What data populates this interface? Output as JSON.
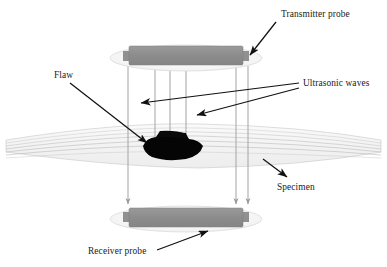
{
  "figure": {
    "background_color": "#ffffff"
  },
  "labels": {
    "transmitter_probe": "Transmitter probe",
    "flaw": "Flaw",
    "ultrasonic_waves": "Ultrasonic waves",
    "specimen": "Specimen",
    "receiver_probe": "Receiver probe"
  },
  "colors": {
    "probe_body": "#8e8e8e",
    "probe_disc": "#f2f2f2",
    "probe_disc_stroke": "#d8d8d8",
    "specimen_fill": "#f4f4f4",
    "specimen_line": "#b9b9b9",
    "wave_line": "#a8a8a8",
    "flaw": "#000000",
    "label_text": "#1a1a1a",
    "leader_line": "#111111"
  },
  "components": {
    "transmitter_probe": {
      "name": "Transmitter probe",
      "disc_center_x": 186,
      "disc_center_y": 58,
      "disc_rx": 76,
      "disc_ry": 13,
      "body_x": 129,
      "body_y": 46,
      "body_width": 114,
      "body_height": 19
    },
    "receiver_probe": {
      "name": "Receiver probe",
      "disc_center_x": 186,
      "disc_center_y": 219,
      "disc_rx": 76,
      "disc_ry": 13,
      "body_x": 129,
      "body_y": 208,
      "body_width": 114,
      "body_height": 19
    },
    "specimen": {
      "name": "Specimen",
      "left_x": 6,
      "right_x": 381,
      "top_y": 124,
      "bottom_y": 168,
      "internal_line_count": 6
    },
    "flaw": {
      "name": "Flaw",
      "center_x": 172,
      "center_y": 147,
      "width": 62,
      "height": 26
    }
  },
  "ultrasonic_waves": {
    "count": 6,
    "x_positions": [
      128,
      155,
      170,
      186,
      236,
      248
    ],
    "start_y": 66,
    "end_y": 208,
    "arrowheads_at_receiver": [
      128,
      236,
      248
    ],
    "blocked_by_flaw": [
      155,
      170,
      186
    ]
  },
  "annotations": [
    {
      "id": "transmitter-probe",
      "text": "Transmitter probe",
      "text_x": 281,
      "text_y": 17,
      "leader_from_x": 276,
      "leader_from_y": 22,
      "leader_to_x": 248,
      "leader_to_y": 56,
      "arrow": true
    },
    {
      "id": "flaw",
      "text": "Flaw",
      "text_x": 54,
      "text_y": 77,
      "leader_from_x": 70,
      "leader_from_y": 83,
      "leader_to_x": 148,
      "leader_to_y": 143,
      "arrow": true
    },
    {
      "id": "ultrasonic-waves-upper",
      "text": "Ultrasonic waves",
      "text_x": 301,
      "text_y": 85,
      "leader_from_x": 297,
      "leader_from_y": 84,
      "leader_to_x": 141,
      "leader_to_y": 103,
      "arrow": true
    },
    {
      "id": "ultrasonic-waves-lower",
      "text": "",
      "leader_from_x": 297,
      "leader_from_y": 90,
      "leader_to_x": 197,
      "leader_to_y": 116,
      "arrow": true
    },
    {
      "id": "specimen",
      "text": "Specimen",
      "text_x": 277,
      "text_y": 187,
      "leader_from_x": 263,
      "leader_from_y": 159,
      "leader_to_x": 288,
      "leader_to_y": 178,
      "arrow": true
    },
    {
      "id": "receiver-probe",
      "text": "Receiver probe",
      "text_x": 88,
      "text_y": 253,
      "leader_from_x": 157,
      "leader_from_y": 250,
      "leader_to_x": 207,
      "leader_to_y": 232,
      "arrow": true
    }
  ]
}
